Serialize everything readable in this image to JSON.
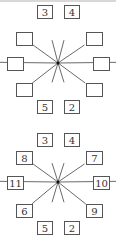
{
  "diagrams": [
    {
      "name": "partial",
      "center": [
        58,
        63
      ],
      "boxes": [
        {
          "id": "top-left",
          "x": 37,
          "y": 5,
          "w": 15,
          "h": 13,
          "label": "3"
        },
        {
          "id": "top-right",
          "x": 64,
          "y": 5,
          "w": 15,
          "h": 13,
          "label": "4"
        },
        {
          "id": "upper-left",
          "x": 16,
          "y": 32,
          "w": 16,
          "h": 13,
          "label": ""
        },
        {
          "id": "upper-right",
          "x": 86,
          "y": 32,
          "w": 16,
          "h": 13,
          "label": ""
        },
        {
          "id": "left",
          "x": 7,
          "y": 57,
          "w": 16,
          "h": 13,
          "label": ""
        },
        {
          "id": "right",
          "x": 93,
          "y": 57,
          "w": 16,
          "h": 13,
          "label": ""
        },
        {
          "id": "lower-left",
          "x": 16,
          "y": 83,
          "w": 16,
          "h": 13,
          "label": ""
        },
        {
          "id": "lower-right",
          "x": 86,
          "y": 83,
          "w": 16,
          "h": 13,
          "label": ""
        },
        {
          "id": "bottom-left",
          "x": 37,
          "y": 100,
          "w": 15,
          "h": 13,
          "label": "5"
        },
        {
          "id": "bottom-right",
          "x": 64,
          "y": 100,
          "w": 15,
          "h": 13,
          "label": "2"
        }
      ]
    },
    {
      "name": "complete",
      "center": [
        58,
        182
      ],
      "boxes": [
        {
          "id": "top-left",
          "x": 37,
          "y": 133,
          "w": 15,
          "h": 13,
          "label": "3"
        },
        {
          "id": "top-right",
          "x": 64,
          "y": 133,
          "w": 15,
          "h": 13,
          "label": "4"
        },
        {
          "id": "upper-left",
          "x": 16,
          "y": 151,
          "w": 16,
          "h": 13,
          "label": "8"
        },
        {
          "id": "upper-right",
          "x": 86,
          "y": 151,
          "w": 16,
          "h": 13,
          "label": "7"
        },
        {
          "id": "left",
          "x": 7,
          "y": 176,
          "w": 16,
          "h": 13,
          "label": "11"
        },
        {
          "id": "right",
          "x": 93,
          "y": 176,
          "w": 16,
          "h": 13,
          "label": "10"
        },
        {
          "id": "lower-left",
          "x": 16,
          "y": 204,
          "w": 16,
          "h": 13,
          "label": "6"
        },
        {
          "id": "lower-right",
          "x": 86,
          "y": 204,
          "w": 16,
          "h": 13,
          "label": "9"
        },
        {
          "id": "bottom-left",
          "x": 37,
          "y": 221,
          "w": 15,
          "h": 13,
          "label": "5"
        },
        {
          "id": "bottom-right",
          "x": 64,
          "y": 221,
          "w": 15,
          "h": 13,
          "label": "2"
        }
      ]
    }
  ]
}
